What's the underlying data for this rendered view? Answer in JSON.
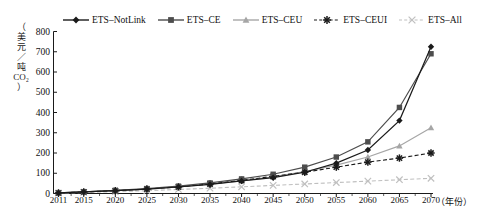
{
  "chart_data": {
    "type": "line",
    "title": "",
    "xlabel": "（年份）",
    "ylabel": "（美元／吨CO₂）",
    "x": [
      2011,
      2015,
      2020,
      2025,
      2030,
      2035,
      2040,
      2045,
      2050,
      2055,
      2060,
      2065,
      2070
    ],
    "categories": [
      "2011",
      "2015",
      "2020",
      "2025",
      "2030",
      "2035",
      "2040",
      "2045",
      "2050",
      "2055",
      "2060",
      "2065",
      "2070"
    ],
    "xlim": [
      2011,
      2072
    ],
    "ylim": [
      0,
      800
    ],
    "yticks": [
      0,
      100,
      200,
      300,
      400,
      500,
      600,
      700,
      800
    ],
    "grid": false,
    "legend_position": "top",
    "series": [
      {
        "name": "ETS–NotLink",
        "color": "#1a1a1a",
        "marker": "diamond",
        "linestyle": "solid",
        "values": [
          3,
          8,
          14,
          22,
          32,
          45,
          62,
          78,
          105,
          150,
          215,
          360,
          725
        ]
      },
      {
        "name": "ETS–CE",
        "color": "#4d4d4d",
        "marker": "square",
        "linestyle": "solid",
        "values": [
          3,
          8,
          15,
          24,
          36,
          52,
          72,
          95,
          130,
          180,
          255,
          425,
          690
        ]
      },
      {
        "name": "ETS–CEU",
        "color": "#a6a6a6",
        "marker": "triangle",
        "linestyle": "solid",
        "values": [
          3,
          8,
          14,
          22,
          32,
          46,
          62,
          82,
          108,
          140,
          180,
          235,
          325
        ]
      },
      {
        "name": "ETS–CEUI",
        "color": "#1a1a1a",
        "marker": "asterisk",
        "linestyle": "dashed",
        "values": [
          3,
          8,
          14,
          22,
          33,
          47,
          65,
          85,
          105,
          130,
          155,
          175,
          200
        ]
      },
      {
        "name": "ETS–All",
        "color": "#bfbfbf",
        "marker": "cross",
        "linestyle": "dashed",
        "values": [
          2,
          5,
          9,
          14,
          20,
          26,
          33,
          40,
          47,
          54,
          61,
          68,
          75
        ]
      }
    ]
  },
  "axis": {
    "y_label_chars": [
      "（",
      "美",
      "元",
      "／",
      "吨",
      "CO₂",
      "）"
    ]
  },
  "colors": {
    "axis": "#1a1a1a",
    "background": "#ffffff",
    "text": "#111111"
  }
}
